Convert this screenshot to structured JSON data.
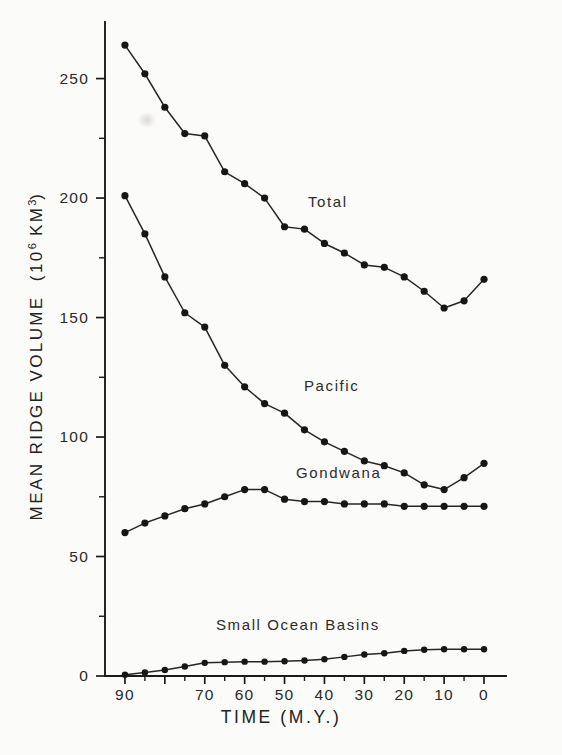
{
  "chart_data": {
    "type": "line",
    "title": "",
    "xlabel": "TIME   (M.Y.)",
    "ylabel": "MEAN RIDGE VOLUME   (10⁶ KM³)",
    "ylabel_main": "MEAN RIDGE VOLUME",
    "ylabel_units_pre": "(10",
    "ylabel_units_sup": "6",
    "ylabel_units_post": " KM",
    "ylabel_units_sup2": "3",
    "ylabel_units_end": ")",
    "xlim": [
      95,
      -2
    ],
    "ylim": [
      0,
      272
    ],
    "x_reversed": true,
    "grid": false,
    "legend_position": "inline-labels",
    "x_major_ticks": [
      90,
      80,
      70,
      60,
      50,
      40,
      30,
      20,
      10,
      0
    ],
    "x_tick_labels": [
      "90",
      "",
      "70",
      "60",
      "50",
      "40",
      "30",
      "20",
      "10",
      "0"
    ],
    "x_minor_ticks": [
      85,
      75,
      65,
      55,
      45,
      35,
      25,
      15,
      5
    ],
    "y_major_ticks": [
      0,
      50,
      100,
      150,
      200,
      250
    ],
    "y_tick_labels": [
      "0",
      "50",
      "100",
      "150",
      "200",
      "250"
    ],
    "y_minor_ticks": [
      25,
      75,
      125,
      175,
      225
    ],
    "x": [
      90,
      85,
      80,
      75,
      70,
      65,
      60,
      55,
      50,
      45,
      40,
      35,
      30,
      25,
      20,
      15,
      10,
      5,
      0
    ],
    "series": [
      {
        "name": "Total",
        "label": "Total",
        "values": [
          264,
          252,
          238,
          227,
          226,
          211,
          206,
          200,
          188,
          187,
          181,
          177,
          172,
          171,
          167,
          161,
          154,
          157,
          166
        ]
      },
      {
        "name": "Pacific",
        "label": "Pacific",
        "values": [
          201,
          185,
          167,
          152,
          146,
          130,
          121,
          114,
          110,
          103,
          98,
          94,
          90,
          88,
          85,
          80,
          78,
          83,
          89
        ]
      },
      {
        "name": "Gondwana",
        "label": "Gondwana",
        "values": [
          60,
          64,
          67,
          70,
          72,
          75,
          78,
          78,
          74,
          73,
          73,
          72,
          72,
          72,
          71,
          71,
          71,
          71,
          71
        ]
      },
      {
        "name": "Small Ocean Basins",
        "label": "Small Ocean Basins",
        "values": [
          0.5,
          1.5,
          2.5,
          4.0,
          5.5,
          5.8,
          6.0,
          6.0,
          6.2,
          6.5,
          7.0,
          8.0,
          9.0,
          9.5,
          10.5,
          11.0,
          11.2,
          11.2,
          11.2
        ]
      }
    ]
  }
}
